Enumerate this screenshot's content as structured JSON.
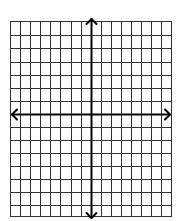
{
  "diagram": {
    "type": "coordinate-plane",
    "grid": {
      "columns": 16,
      "rows": 15,
      "columns_left_of_y_axis": 8,
      "columns_right_of_y_axis": 8,
      "rows_above_x_axis": 7,
      "rows_below_x_axis": 8,
      "left": 10,
      "right": 171,
      "top": 21,
      "bottom": 216,
      "x_lines": [
        10,
        20,
        30,
        40,
        50,
        60,
        71,
        81,
        91,
        101,
        111,
        121,
        131,
        141,
        151,
        161,
        171
      ],
      "y_lines": [
        21,
        35,
        48,
        62,
        75,
        88,
        101,
        114,
        127,
        140,
        153,
        166,
        179,
        192,
        205,
        216
      ],
      "line_color": "#333333"
    },
    "axes": {
      "origin": {
        "x": 91,
        "y": 114
      },
      "x_axis": {
        "from": 12,
        "to": 170,
        "arrows": "both"
      },
      "y_axis": {
        "from": 19,
        "to": 218,
        "arrows": "both"
      },
      "color": "#000000"
    },
    "labels": []
  }
}
